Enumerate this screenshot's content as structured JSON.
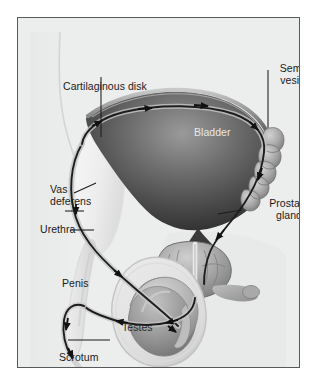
{
  "figure": {
    "kind": "anatomical-illustration",
    "frame_border_color": "#58595b",
    "plate_background_color": "#eceded",
    "label_text_color": "#1b1b1b",
    "organ_label_text_color": "#e8e8e8",
    "leader_line_color": "#1b1b1b",
    "flow_arrow_color": "#111111"
  },
  "labels": {
    "cartilaginous_disk": "Cartilaginous disk",
    "seminal_vesicles_line1": "Seminal",
    "seminal_vesicles_line2": "vesicles",
    "bladder": "Bladder",
    "vas_deferens_line1": "Vas",
    "vas_deferens_line2": "deferens",
    "urethra": "Urethra",
    "prostate_gland_line1": "Prostate",
    "prostate_gland_line2": "gland",
    "penis": "Penis",
    "testes": "Testes",
    "scrotum": "Scrotum"
  },
  "structures": [
    {
      "name": "bladder",
      "label": "Bladder",
      "shading": "dark-radial"
    },
    {
      "name": "seminal-vesicles",
      "label": "Seminal vesicles",
      "shading": "lobed-medium"
    },
    {
      "name": "prostate-gland",
      "label": "Prostate gland",
      "shading": "lobed-medium"
    },
    {
      "name": "vas-deferens",
      "label": "Vas deferens",
      "shading": "tube-dark"
    },
    {
      "name": "urethra",
      "label": "Urethra",
      "shading": "tube-dark"
    },
    {
      "name": "cartilaginous-disk",
      "label": "Cartilaginous disk",
      "shading": "pale"
    },
    {
      "name": "penis",
      "label": "Penis",
      "shading": "pale"
    },
    {
      "name": "testes",
      "label": "Testes",
      "shading": "oval-medium"
    },
    {
      "name": "scrotum",
      "label": "Scrotum",
      "shading": "pale-outline"
    }
  ]
}
